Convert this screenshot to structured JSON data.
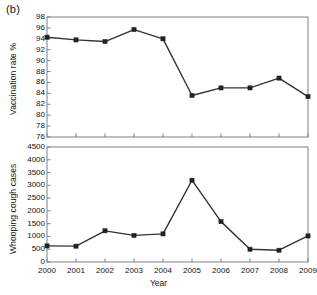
{
  "figure": {
    "panel_label": "(b)",
    "xlabel": "Year",
    "ylabel_top": "Vaccination rate %",
    "ylabel_bottom": "Whooping cough cases",
    "line_color": "#333333",
    "marker_color": "#222222",
    "axis_color": "#808080"
  },
  "chart_data": [
    {
      "type": "line",
      "title": "(b)",
      "panel": "top",
      "xlabel": "",
      "ylabel": "Vaccination rate %",
      "x": [
        2000,
        2001,
        2002,
        2003,
        2004,
        2005,
        2006,
        2007,
        2008,
        2009
      ],
      "categories": [
        "2000",
        "2001",
        "2002",
        "2003",
        "2004",
        "2005",
        "2006",
        "2007",
        "2008",
        "2009"
      ],
      "values": [
        94.3,
        93.8,
        93.5,
        95.7,
        94.0,
        83.6,
        85.0,
        85.0,
        86.8,
        83.4
      ],
      "ylim": [
        76,
        98
      ],
      "ytick_values": [
        76,
        78,
        80,
        82,
        84,
        86,
        88,
        90,
        92,
        94,
        96,
        98
      ],
      "yticks": [
        "76",
        "78",
        "80",
        "82",
        "84",
        "86",
        "88",
        "90",
        "92",
        "94",
        "96",
        "98"
      ],
      "xlim": [
        2000,
        2009
      ],
      "grid": false,
      "legend": null,
      "marker": "square"
    },
    {
      "type": "line",
      "panel": "bottom",
      "xlabel": "Year",
      "ylabel": "Whooping cough cases",
      "x": [
        2000,
        2001,
        2002,
        2003,
        2004,
        2005,
        2006,
        2007,
        2008,
        2009
      ],
      "categories": [
        "2000",
        "2001",
        "2002",
        "2003",
        "2004",
        "2005",
        "2006",
        "2007",
        "2008",
        "2009"
      ],
      "values": [
        630,
        620,
        1220,
        1040,
        1100,
        3200,
        1580,
        500,
        460,
        1020
      ],
      "ylim": [
        0,
        4500
      ],
      "ytick_values": [
        0,
        500,
        1000,
        1500,
        2000,
        2500,
        3000,
        3500,
        4000,
        4500
      ],
      "yticks": [
        "0",
        "500",
        "1000",
        "1500",
        "2000",
        "2500",
        "3000",
        "3500",
        "4000",
        "4500"
      ],
      "xtick_values": [
        2000,
        2001,
        2002,
        2003,
        2004,
        2005,
        2006,
        2007,
        2008,
        2009
      ],
      "xticks": [
        "2000",
        "2001",
        "2002",
        "2003",
        "2004",
        "2005",
        "2006",
        "2007",
        "2008",
        "2009"
      ],
      "grid": false,
      "legend": null,
      "marker": "square"
    }
  ]
}
